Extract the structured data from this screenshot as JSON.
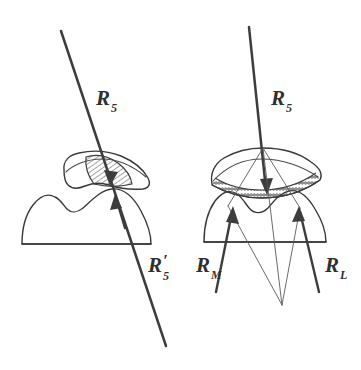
{
  "figure": {
    "background_color": "#ffffff",
    "ink_color": "#3a3a3a",
    "width": 361,
    "height": 370
  },
  "panels": [
    {
      "id": "left",
      "name": "single-resultant-panel",
      "description": "Upper and lower molar cross-sections with a single resultant force vector passing through the contact area",
      "labels": [
        {
          "name": "resultant-r5-label",
          "base": "R",
          "subscript": "5",
          "prime": "",
          "x": 96,
          "y": 105
        },
        {
          "name": "resultant-r5-prime-label",
          "base": "R",
          "subscript": "5",
          "prime": "′",
          "x": 148,
          "y": 272
        }
      ],
      "shading": {
        "name": "contact-hatched-region",
        "pattern": "diagonal-hatch",
        "description": "Hatched contact/wear facet region inside the upper molar"
      }
    },
    {
      "id": "right",
      "name": "decomposed-resultant-panel",
      "description": "Upper and lower molar cross-sections with the resultant decomposed into mesial and lateral component vectors converging below",
      "labels": [
        {
          "name": "resultant-r5-label",
          "base": "R",
          "subscript": "5",
          "prime": "",
          "x": 271,
          "y": 105
        },
        {
          "name": "component-rm-label",
          "base": "R",
          "subscript": "M",
          "prime": "",
          "x": 200,
          "y": 272
        },
        {
          "name": "component-rl-label",
          "base": "R",
          "subscript": "L",
          "prime": "",
          "x": 325,
          "y": 272
        }
      ],
      "shading": {
        "name": "occlusal-bead-band",
        "pattern": "beaded-band",
        "description": "Beaded/stippled band along the occlusal surface of the upper molar"
      }
    }
  ],
  "geometry": {
    "left_panel": {
      "main_vector": {
        "x1": 61,
        "y1": 31,
        "x2": 166,
        "y2": 346
      },
      "arrow_down_tip": {
        "x": 110,
        "y": 182
      },
      "arrow_up_tip": {
        "x": 117,
        "y": 196
      },
      "upper_tooth_outline": "rounded lobed crown, apex near x=95",
      "lower_tooth_outline": "two-cusped crown on flat base line y=244"
    },
    "right_panel": {
      "main_vector": {
        "x1": 249,
        "y1": 27,
        "x2": 266,
        "y2": 190
      },
      "apex_point": {
        "x": 263,
        "y": 148
      },
      "component_mesial": {
        "x1": 216,
        "y1": 292,
        "x2": 263,
        "y2": 148
      },
      "component_lateral": {
        "x1": 319,
        "y1": 292,
        "x2": 263,
        "y2": 148
      },
      "convergence_point": {
        "x": 282,
        "y": 305
      },
      "base_line_y": 242
    }
  }
}
